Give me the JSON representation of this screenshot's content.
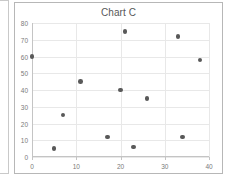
{
  "chart": {
    "title": "Chart C",
    "frame_color": "#b7b7b7",
    "grid_color": "#e8e8e8",
    "axis_color": "#c4c4c4",
    "marker_color": "#595959",
    "tick_text_color": "#7a7a7a",
    "title_text_color": "#585858"
  },
  "chart_data": {
    "type": "scatter",
    "title": "Chart C",
    "xlabel": "",
    "ylabel": "",
    "xlim": [
      0,
      40
    ],
    "ylim": [
      0,
      80
    ],
    "xticks": [
      0,
      10,
      20,
      30,
      40
    ],
    "yticks": [
      0,
      10,
      20,
      30,
      40,
      50,
      60,
      70,
      80
    ],
    "xtick_labels": [
      "0",
      "10",
      "20",
      "30",
      "40"
    ],
    "ytick_labels": [
      "0",
      "10",
      "20",
      "30",
      "40",
      "50",
      "60",
      "70",
      "80"
    ],
    "grid": true,
    "legend": false,
    "series": [
      {
        "name": "Series 1",
        "marker": "circle",
        "color": "#595959",
        "points": [
          {
            "x": 0,
            "y": 60
          },
          {
            "x": 5,
            "y": 5
          },
          {
            "x": 7,
            "y": 25
          },
          {
            "x": 11,
            "y": 45
          },
          {
            "x": 17,
            "y": 12
          },
          {
            "x": 20,
            "y": 40
          },
          {
            "x": 21,
            "y": 75
          },
          {
            "x": 23,
            "y": 6
          },
          {
            "x": 26,
            "y": 35
          },
          {
            "x": 33,
            "y": 72
          },
          {
            "x": 34,
            "y": 12
          },
          {
            "x": 38,
            "y": 58
          }
        ]
      }
    ]
  }
}
